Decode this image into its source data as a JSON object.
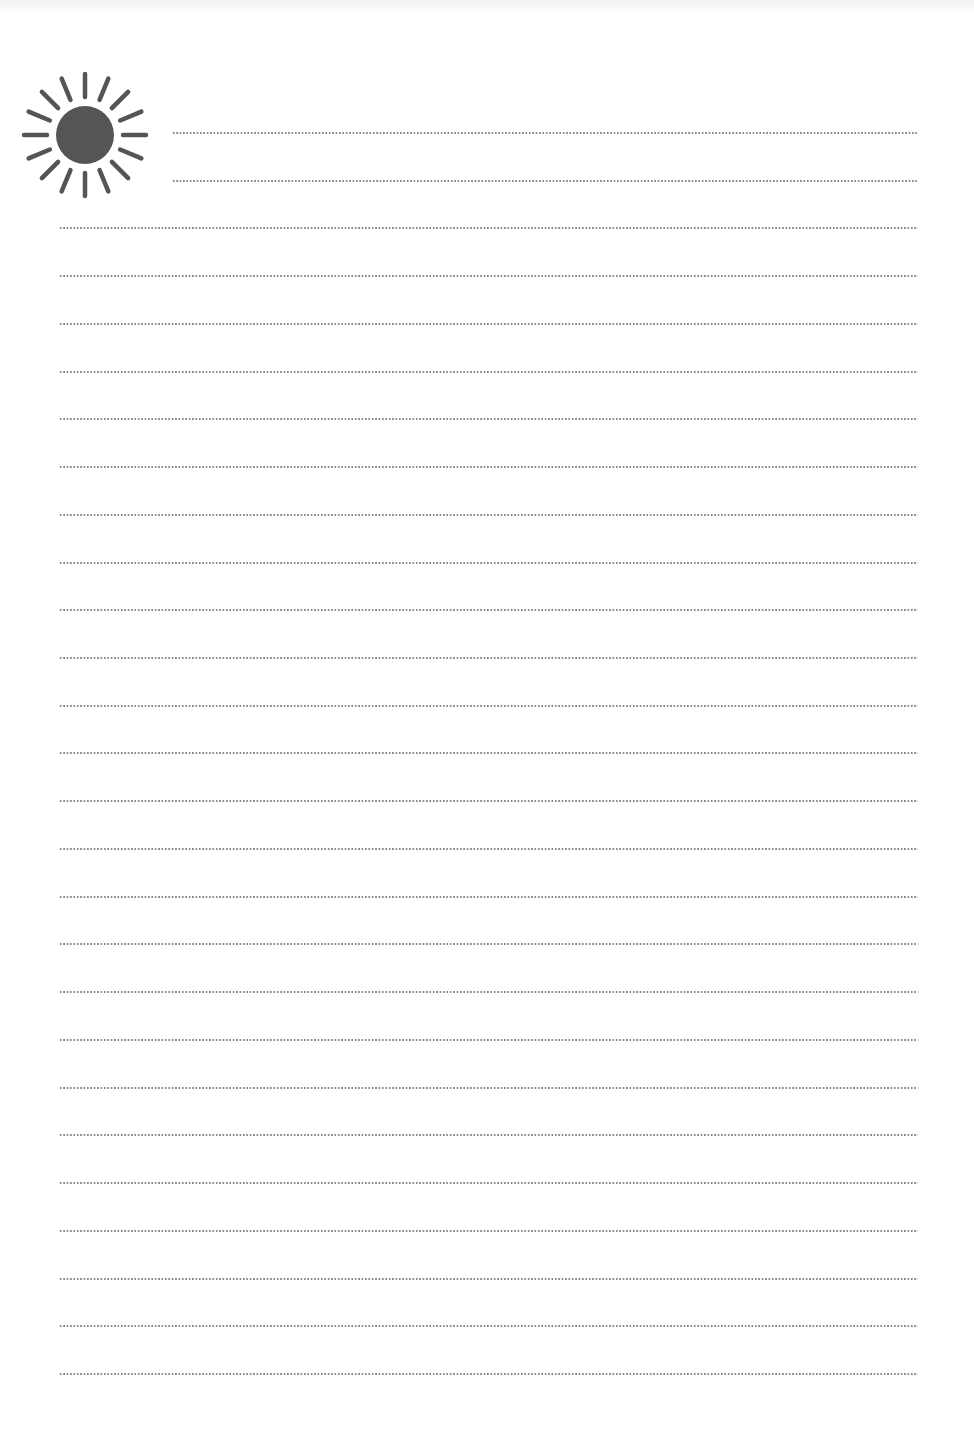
{
  "page": {
    "type": "lined-writing-paper",
    "background": "#ffffff"
  },
  "icon": {
    "name": "sun-icon",
    "color": "#555555",
    "rays": 16
  },
  "rules": {
    "style": "dotted",
    "color": "#8a8a8a",
    "count": 27,
    "short_count": 2,
    "first_y": 133,
    "spacing": 47.73,
    "short_left": 172,
    "full_left": 59,
    "right": 918
  }
}
